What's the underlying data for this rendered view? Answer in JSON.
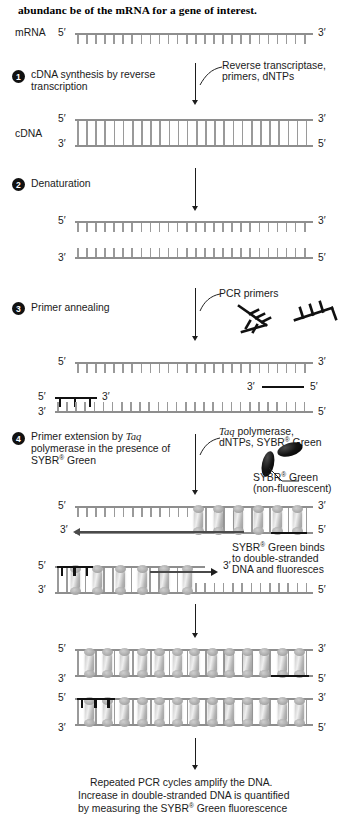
{
  "figure": {
    "heading": "abundanc be of the mRNA for a gene of interest.",
    "molecule_labels": {
      "mrna": "mRNA",
      "cdna": "cDNA"
    },
    "prime_5": "5′",
    "prime_3": "3′"
  },
  "steps": [
    {
      "number": "1",
      "text": "cDNA synthesis by reverse transcription"
    },
    {
      "number": "2",
      "text": "Denaturation"
    },
    {
      "number": "3",
      "text": "Primer annealing"
    },
    {
      "number": "4",
      "text_a": "Primer extension by ",
      "text_italic": "Taq",
      "text_b": " polymerase in the presence of SYBR",
      "sup": "®",
      "text_c": " Green"
    }
  ],
  "annotations": {
    "reagents_step1_line1": "Reverse transcriptase,",
    "reagents_step1_line2": "primers, dNTPs",
    "pcr_primers": "PCR primers",
    "reagents_step4_italic": "Taq",
    "reagents_step4_line1_rest": " polymerase,",
    "reagents_step4_line2_a": "dNTPs, SYBR",
    "reagents_step4_line2_sup": "®",
    "reagents_step4_line2_b": " Green",
    "sybr_label_a": "SYBR",
    "sybr_label_sup": "®",
    "sybr_label_b": " Green",
    "sybr_label_line2": "(non-fluorescent)",
    "binds_line1_a": "SYBR",
    "binds_line1_sup": "®",
    "binds_line1_b": " Green binds",
    "binds_line2": "to double-stranded",
    "binds_line3": "DNA and fluoresces"
  },
  "caption": {
    "line1": "Repeated PCR cycles amplify the DNA.",
    "line2": "Increase in double-stranded DNA is quantified",
    "line3_a": "by measuring the SYBR",
    "line3_sup": "®",
    "line3_b": " Green fluorescence"
  },
  "colors": {
    "background": "#ffffff",
    "text": "#1a1a1a",
    "strand": "#8e8e8e",
    "primer": "#111111",
    "sybr_dye": "#000000",
    "sybr_bound": "#bdbdbd"
  }
}
